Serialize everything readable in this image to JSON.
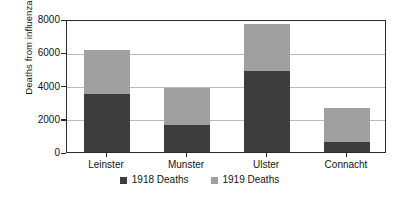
{
  "chart_data": {
    "type": "bar",
    "subtype": "stacked-bar",
    "title": "",
    "xlabel": "",
    "ylabel": "Deaths  from influenza",
    "ylim": [
      0,
      8000
    ],
    "ytick_labels": [
      "8000",
      "6000",
      "4000",
      "2000",
      "0"
    ],
    "ytick_values": [
      8000,
      6000,
      4000,
      2000,
      0
    ],
    "grid": true,
    "legend_position": "bottom",
    "categories": [
      "Leinster",
      "Munster",
      "Ulster",
      "Connacht"
    ],
    "series": [
      {
        "name": "1918 Deaths",
        "color": "#3d3d3d",
        "values": [
          3500,
          1650,
          4900,
          600
        ]
      },
      {
        "name": "1919 Deaths",
        "color": "#a0a0a0",
        "values": [
          2650,
          2200,
          2800,
          2050
        ]
      }
    ],
    "totals": [
      6150,
      3850,
      7700,
      2650
    ]
  },
  "legend": {
    "entries": [
      {
        "label": "1918 Deaths",
        "color": "#3d3d3d"
      },
      {
        "label": "1919 Deaths",
        "color": "#a0a0a0"
      }
    ]
  },
  "axis": {
    "y_title": "Deaths  from influenza"
  }
}
